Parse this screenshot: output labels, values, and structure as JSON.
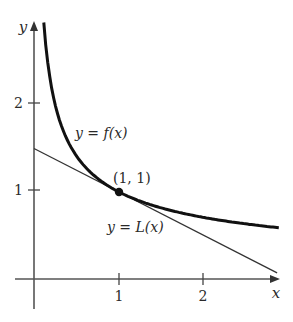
{
  "chart_data": {
    "type": "line",
    "title": "",
    "xlabel": "x",
    "ylabel": "y",
    "xlim": [
      -0.22,
      2.9
    ],
    "ylim": [
      -0.35,
      2.95
    ],
    "grid": false,
    "x_ticks": [
      {
        "value": 1,
        "label": "1"
      },
      {
        "value": 2,
        "label": "2"
      }
    ],
    "y_ticks": [
      {
        "value": 1,
        "label": "1"
      },
      {
        "value": 2,
        "label": "2"
      }
    ],
    "series": [
      {
        "name": "f",
        "label": "y = f(x)",
        "style": "thick",
        "x": [
          0.115,
          0.15,
          0.2,
          0.3,
          0.4,
          0.5,
          0.6,
          0.8,
          1.0,
          1.25,
          1.5,
          2.0,
          2.5,
          2.88
        ],
        "y": [
          2.95,
          2.58,
          2.24,
          1.83,
          1.58,
          1.41,
          1.29,
          1.12,
          1.0,
          0.89,
          0.82,
          0.71,
          0.63,
          0.59
        ]
      },
      {
        "name": "L",
        "label": "y = L(x)",
        "style": "thin",
        "x": [
          0,
          2.86
        ],
        "y": [
          1.5,
          0.07
        ]
      }
    ],
    "annotations": [
      {
        "text": "(1, 1)",
        "x": 1,
        "y": 1,
        "marker": "dot"
      },
      {
        "text": "y = f(x)",
        "target": "f"
      },
      {
        "text": "y = L(x)",
        "target": "L"
      }
    ]
  },
  "labels": {
    "x_axis": "x",
    "y_axis": "y",
    "tick_x1": "1",
    "tick_x2": "2",
    "tick_y1": "1",
    "tick_y2": "2",
    "point": "(1, 1)",
    "f_label": "y = f(x)",
    "L_label": "y = L(x)"
  }
}
